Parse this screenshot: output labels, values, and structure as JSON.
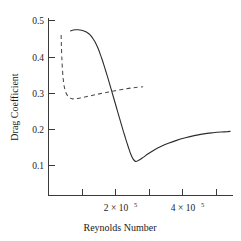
{
  "chart_data": {
    "type": "line",
    "title": "",
    "xlabel": "Reynolds Number",
    "ylabel": "Drag Coefficient",
    "xlim": [
      0,
      585000
    ],
    "ylim": [
      0.04,
      0.53
    ],
    "grid": false,
    "legend": "none",
    "xticks": [
      0,
      100000,
      200000,
      300000,
      400000,
      500000
    ],
    "xticklabels": [
      "",
      "",
      "2 × 10",
      "",
      "4 × 10",
      ""
    ],
    "xtick_exponents": [
      "",
      "",
      "5",
      "",
      "5",
      ""
    ],
    "xticklabel_2": "2 × 10",
    "xticklabel_2_exp": "5",
    "xticklabel_4": "4 × 10",
    "xticklabel_4_exp": "5",
    "yticks": [
      0.1,
      0.2,
      0.3,
      0.4,
      0.5
    ],
    "yticklabels": [
      "0.1",
      "0.2",
      "0.3",
      "0.4",
      "0.5"
    ],
    "series": [
      {
        "name": "solid-curve",
        "style": "solid",
        "color": "#2b2b2b",
        "x": [
          70000,
          76000,
          84000,
          94000,
          104000,
          112000,
          120000,
          128000,
          134000,
          140000,
          146000,
          152000,
          158000,
          164000,
          170000,
          176000,
          182000,
          188000,
          194000,
          200000,
          206000,
          212000,
          218000,
          224000,
          230000,
          236000,
          242000,
          248000,
          254000,
          260000,
          268000,
          276000,
          286000,
          300000,
          316000,
          334000,
          356000,
          380000,
          406000,
          434000,
          462000,
          492000,
          522000,
          548000,
          566000,
          576000
        ],
        "y": [
          0.472,
          0.474,
          0.475,
          0.475,
          0.474,
          0.472,
          0.469,
          0.464,
          0.459,
          0.452,
          0.444,
          0.434,
          0.422,
          0.408,
          0.393,
          0.377,
          0.36,
          0.343,
          0.325,
          0.307,
          0.289,
          0.271,
          0.253,
          0.235,
          0.217,
          0.199,
          0.182,
          0.165,
          0.149,
          0.134,
          0.119,
          0.112,
          0.115,
          0.123,
          0.133,
          0.143,
          0.153,
          0.162,
          0.17,
          0.177,
          0.183,
          0.188,
          0.191,
          0.193,
          0.194,
          0.195
        ]
      },
      {
        "name": "dashed-curve",
        "style": "dashed",
        "color": "#4a4a4a",
        "x": [
          40000,
          40500,
          41000,
          42000,
          43500,
          46000,
          50000,
          56000,
          64000,
          74000,
          88000,
          106000,
          128000,
          154000,
          182000,
          212000,
          244000,
          276000,
          300000
        ],
        "y": [
          0.461,
          0.446,
          0.428,
          0.404,
          0.376,
          0.345,
          0.318,
          0.3,
          0.29,
          0.285,
          0.285,
          0.288,
          0.292,
          0.297,
          0.302,
          0.307,
          0.312,
          0.316,
          0.318
        ]
      }
    ]
  },
  "axis": {
    "y_title": "Drag Coefficient",
    "x_title": "Reynolds Number"
  }
}
